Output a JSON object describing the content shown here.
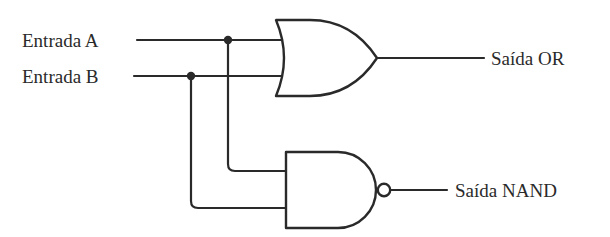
{
  "diagram": {
    "type": "logic-circuit",
    "inputs": [
      {
        "id": "A",
        "label": "Entrada A"
      },
      {
        "id": "B",
        "label": "Entrada B"
      }
    ],
    "gates": [
      {
        "id": "or1",
        "type": "OR",
        "inputs": [
          "A",
          "B"
        ],
        "output": "Saída OR"
      },
      {
        "id": "nand1",
        "type": "NAND",
        "inputs": [
          "A",
          "B"
        ],
        "output": "Saída NAND"
      }
    ],
    "outputs": [
      {
        "id": "or_out",
        "label": "Saída OR"
      },
      {
        "id": "nand_out",
        "label": "Saída NAND"
      }
    ],
    "colors": {
      "stroke": "#2a2a2a",
      "background": "#ffffff"
    }
  }
}
